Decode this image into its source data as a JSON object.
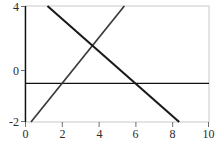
{
  "chart_data": {
    "type": "line",
    "title": "",
    "xlabel": "",
    "ylabel": "",
    "xlim": [
      0,
      10
    ],
    "ylim": [
      -2,
      4
    ],
    "grid": false,
    "legend": "none",
    "xticks": [
      0,
      2,
      4,
      6,
      8,
      10
    ],
    "yticks": [
      -2,
      0,
      4
    ],
    "xtick_labels": [
      "0",
      "2",
      "4",
      "6",
      "8",
      "10"
    ],
    "ytick_labels": [
      "-2",
      "0",
      "4"
    ],
    "axis_color": "#000000",
    "frame_color": "#c8c8c8",
    "series": [
      {
        "name": "ascending-line",
        "color": "#3a3a3a",
        "x": [
          0.3,
          5.4
        ],
        "y": [
          -2,
          4
        ],
        "slope": 1.18,
        "intercept": -2.35,
        "x_intercept": 2.0
      },
      {
        "name": "descending-line",
        "color": "#1a1a1a",
        "x": [
          1.2,
          8.4
        ],
        "y": [
          4,
          -2
        ],
        "slope": -0.83,
        "intercept": 5.0,
        "x_intercept": 6.0
      }
    ],
    "intersection": {
      "x": 4.25,
      "y": 2.2
    }
  },
  "axes": {
    "y_axis_name": "y-axis",
    "x_axis_name": "x-axis",
    "zero_line_name": "zero-line"
  }
}
